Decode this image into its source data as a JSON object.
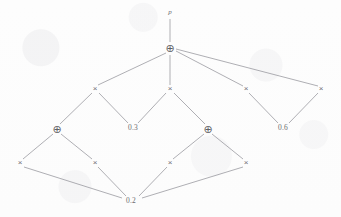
{
  "figure": {
    "width": 341,
    "height": 217,
    "background_color": "#fdfdfd",
    "edge_color": "#8d8d93",
    "node_color": "#6f6f74"
  },
  "glyphs": {
    "times": "×",
    "plus_circle": "⊕"
  },
  "nodes": [
    {
      "id": "root_label",
      "kind": "variable",
      "label": "p",
      "x": 170,
      "y": 12,
      "icon": "variable-label"
    },
    {
      "id": "add_top",
      "kind": "plus",
      "label": "⊕",
      "x": 170,
      "y": 48,
      "icon": "plus-circle-icon"
    },
    {
      "id": "mul_r2_c1",
      "kind": "times",
      "label": "×",
      "x": 95,
      "y": 89,
      "icon": "times-icon"
    },
    {
      "id": "mul_r2_c2",
      "kind": "times",
      "label": "×",
      "x": 170,
      "y": 89,
      "icon": "times-icon"
    },
    {
      "id": "mul_r2_c3",
      "kind": "times",
      "label": "×",
      "x": 246,
      "y": 89,
      "icon": "times-icon"
    },
    {
      "id": "mul_r2_c4",
      "kind": "times",
      "label": "×",
      "x": 321,
      "y": 89,
      "icon": "times-icon"
    },
    {
      "id": "add_left",
      "kind": "plus",
      "label": "⊕",
      "x": 57,
      "y": 129,
      "icon": "plus-circle-icon"
    },
    {
      "id": "const_03",
      "kind": "constant",
      "label": "0.3",
      "x": 133,
      "y": 128,
      "icon": "constant-label"
    },
    {
      "id": "add_right",
      "kind": "plus",
      "label": "⊕",
      "x": 208,
      "y": 129,
      "icon": "plus-circle-icon"
    },
    {
      "id": "const_06",
      "kind": "constant",
      "label": "0.6",
      "x": 283,
      "y": 128,
      "icon": "constant-label"
    },
    {
      "id": "mul_r4_c1",
      "kind": "times",
      "label": "×",
      "x": 20,
      "y": 163,
      "icon": "times-icon"
    },
    {
      "id": "mul_r4_c2",
      "kind": "times",
      "label": "×",
      "x": 95,
      "y": 163,
      "icon": "times-icon"
    },
    {
      "id": "mul_r4_c3",
      "kind": "times",
      "label": "×",
      "x": 170,
      "y": 163,
      "icon": "times-icon"
    },
    {
      "id": "mul_r4_c4",
      "kind": "times",
      "label": "×",
      "x": 246,
      "y": 163,
      "icon": "times-icon"
    },
    {
      "id": "const_02",
      "kind": "constant",
      "label": "0.2",
      "x": 131,
      "y": 201,
      "icon": "constant-label"
    }
  ],
  "edges": [
    {
      "from": "root_label",
      "to": "add_top",
      "x1": 170,
      "y1": 19,
      "x2": 170,
      "y2": 42
    },
    {
      "from": "add_top",
      "to": "mul_r2_c1",
      "x1": 166,
      "y1": 53,
      "x2": 98,
      "y2": 85
    },
    {
      "from": "add_top",
      "to": "mul_r2_c2",
      "x1": 170,
      "y1": 55,
      "x2": 170,
      "y2": 85
    },
    {
      "from": "add_top",
      "to": "mul_r2_c3",
      "x1": 176,
      "y1": 51,
      "x2": 243,
      "y2": 86
    },
    {
      "from": "add_top",
      "to": "mul_r2_c4",
      "x1": 176,
      "y1": 49,
      "x2": 318,
      "y2": 86
    },
    {
      "from": "mul_r2_c1",
      "to": "add_left",
      "x1": 92,
      "y1": 93,
      "x2": 60,
      "y2": 124
    },
    {
      "from": "mul_r2_c1",
      "to": "const_03",
      "x1": 99,
      "y1": 93,
      "x2": 128,
      "y2": 123
    },
    {
      "from": "mul_r2_c2",
      "to": "const_03",
      "x1": 166,
      "y1": 93,
      "x2": 138,
      "y2": 123
    },
    {
      "from": "mul_r2_c2",
      "to": "add_right",
      "x1": 174,
      "y1": 93,
      "x2": 205,
      "y2": 124
    },
    {
      "from": "mul_r2_c3",
      "to": "const_06",
      "x1": 249,
      "y1": 93,
      "x2": 278,
      "y2": 123
    },
    {
      "from": "mul_r2_c4",
      "to": "const_06",
      "x1": 318,
      "y1": 93,
      "x2": 289,
      "y2": 123
    },
    {
      "from": "add_left",
      "to": "mul_r4_c1",
      "x1": 53,
      "y1": 134,
      "x2": 23,
      "y2": 159
    },
    {
      "from": "add_left",
      "to": "mul_r4_c2",
      "x1": 61,
      "y1": 134,
      "x2": 92,
      "y2": 159
    },
    {
      "from": "add_right",
      "to": "mul_r4_c3",
      "x1": 204,
      "y1": 134,
      "x2": 173,
      "y2": 159
    },
    {
      "from": "add_right",
      "to": "mul_r4_c4",
      "x1": 212,
      "y1": 134,
      "x2": 243,
      "y2": 159
    },
    {
      "from": "mul_r4_c1",
      "to": "const_02",
      "x1": 24,
      "y1": 167,
      "x2": 122,
      "y2": 198
    },
    {
      "from": "mul_r4_c2",
      "to": "const_02",
      "x1": 98,
      "y1": 167,
      "x2": 126,
      "y2": 196
    },
    {
      "from": "mul_r4_c3",
      "to": "const_02",
      "x1": 167,
      "y1": 167,
      "x2": 139,
      "y2": 196
    },
    {
      "from": "mul_r4_c4",
      "to": "const_02",
      "x1": 243,
      "y1": 167,
      "x2": 142,
      "y2": 198
    }
  ]
}
